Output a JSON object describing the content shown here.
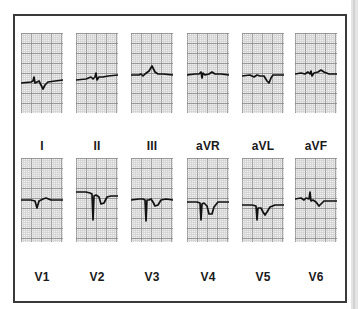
{
  "figure": {
    "title": "",
    "colors": {
      "grid_minor": "#c9c9c9",
      "grid_major": "#8e8e8e",
      "grid_bg": "#eeeeee",
      "trace": "#111111",
      "frame": "#3a3a3a"
    },
    "rows": [
      {
        "leads": [
          {
            "label": "I",
            "path": "M0,50 L10,49 L12,48 L13,44 L14,50 L16,49 L18,48 L20,52 L22,56 L24,52 L27,49 L34,48 L42,47"
          },
          {
            "label": "II",
            "path": "M0,47 L10,46 L15,44 L17,46 L19,44 L20,40 L21,47 L23,44 L27,44 L32,43 L42,42"
          },
          {
            "label": "III",
            "path": "M0,42 L8,42 L10,41 L12,43 L14,41 L18,38 L21,33 L24,39 L27,41 L32,41 L42,42"
          },
          {
            "label": "aVR",
            "path": "M0,42 L8,41 L12,41 L14,39 L15,45 L16,40 L18,42 L22,41 L25,39 L28,41 L34,41 L42,42"
          },
          {
            "label": "aVL",
            "path": "M0,43 L8,42 L12,44 L15,42 L18,43 L22,43 L25,48 L27,50 L29,45 L31,42 L36,42 L42,42"
          },
          {
            "label": "aVF",
            "path": "M0,41 L6,40 L10,41 L13,39 L15,41 L16,38 L17,43 L19,40 L23,39 L26,37 L29,39 L34,41 L42,41"
          }
        ]
      },
      {
        "leads": [
          {
            "label": "V1",
            "path": "M0,42 L10,42 L14,43 L16,50 L18,43 L22,41 L25,40 L30,42 L42,42"
          },
          {
            "label": "V2",
            "path": "M0,34 L10,34 L14,35 L16,36 L17,62 L18,38 L20,37 L23,39 L25,46 L28,45 L31,39 L35,38 L42,38"
          },
          {
            "label": "V3",
            "path": "M0,42 L8,41 L12,41 L14,42 L15,63 L16,42 L18,42 L20,41 L22,44 L24,48 L27,47 L30,42 L35,41 L42,42"
          },
          {
            "label": "V4",
            "path": "M0,44 L10,44 L13,45 L14,62 L15,46 L17,45 L20,48 L22,56 L25,56 L27,49 L31,44 L36,44 L42,44"
          },
          {
            "label": "V5",
            "path": "M0,47 L10,47 L14,48 L15,62 L16,50 L19,50 L21,54 L23,57 L25,54 L28,49 L33,47 L42,47"
          },
          {
            "label": "V6",
            "path": "M0,41 L6,40 L9,42 L11,40 L14,41 L15,34 L16,43 L18,42 L21,44 L24,48 L26,46 L29,43 L34,43 L42,43"
          }
        ]
      }
    ]
  }
}
